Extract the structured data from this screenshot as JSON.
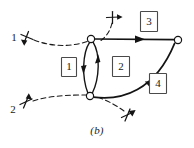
{
  "figure": {
    "caption": "(b)",
    "title": "(b)",
    "background_color": "#ffffff",
    "ink_color": "#141414",
    "box_stroke_color": "#4a4a4a"
  },
  "region_labels": [
    {
      "id": "region-1",
      "text": "1",
      "x": 69,
      "y": 67
    },
    {
      "id": "region-2",
      "text": "2",
      "x": 121,
      "y": 67
    },
    {
      "id": "region-3",
      "text": "3",
      "x": 149,
      "y": 22
    },
    {
      "id": "region-4",
      "text": "4",
      "x": 158,
      "y": 84
    }
  ],
  "branch_markers": [
    {
      "id": "branch-marker-1",
      "text": "1",
      "x": 14,
      "y": 38
    },
    {
      "id": "branch-marker-2",
      "text": "2",
      "x": 13,
      "y": 110
    }
  ],
  "nodes": [
    {
      "id": "node-top",
      "x": 91,
      "y": 39,
      "r": 3.6
    },
    {
      "id": "node-bottom",
      "x": 90,
      "y": 96,
      "r": 3.6
    },
    {
      "id": "node-right",
      "x": 178,
      "y": 40,
      "r": 3.6
    }
  ],
  "contour_segments": [
    {
      "id": "segment-1-left-arc",
      "label": "1",
      "direction": "downward"
    },
    {
      "id": "segment-2-right-arc",
      "label": "2",
      "direction": "upward"
    },
    {
      "id": "segment-3-top-line",
      "label": "3",
      "direction": "rightward"
    },
    {
      "id": "segment-4-bottom-curve",
      "label": "4",
      "direction": "upward-right"
    }
  ],
  "cross_markers": [
    {
      "id": "cross-marker-top",
      "x": 113,
      "y": 17
    },
    {
      "id": "cross-marker-bottom",
      "x": 128,
      "y": 116
    },
    {
      "id": "cross-marker-left-1",
      "x": 27,
      "y": 37
    },
    {
      "id": "cross-marker-left-2",
      "x": 26,
      "y": 103
    }
  ]
}
